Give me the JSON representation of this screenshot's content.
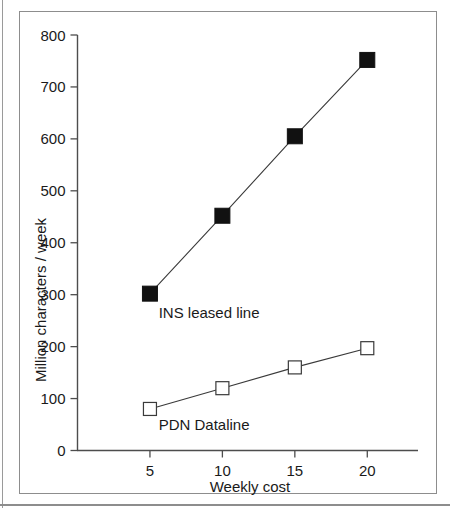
{
  "figure": {
    "frame_color": "#8d8d8d",
    "background": "#ffffff"
  },
  "chart_data": {
    "type": "line",
    "title": "",
    "subtitle": "",
    "xlabel": "Weekly cost",
    "ylabel": "Million characters / week",
    "x": [
      5,
      10,
      15,
      20
    ],
    "xlim": [
      0,
      23.5
    ],
    "ylim": [
      0,
      800
    ],
    "xticks": [
      5,
      10,
      15,
      20
    ],
    "xtick_labels": [
      "5",
      "10",
      "15",
      "20"
    ],
    "yticks": [
      0,
      100,
      200,
      300,
      400,
      500,
      600,
      700,
      800
    ],
    "ytick_labels": [
      "0",
      "100",
      "200",
      "300",
      "400",
      "500",
      "600",
      "700",
      "800"
    ],
    "grid": false,
    "legend_position": "inline-annotation",
    "series": [
      {
        "name": "INS leased line",
        "marker": "filled-square",
        "color": "#111111",
        "values": [
          302,
          452,
          605,
          752
        ],
        "annotation": "INS leased line"
      },
      {
        "name": "PDN Dataline",
        "marker": "open-square",
        "color": "#3a3a3a",
        "values": [
          80,
          120,
          160,
          197
        ],
        "annotation": "PDN Dataline"
      }
    ],
    "annotations": [
      {
        "text": "INS leased line",
        "x": 5.6,
        "y": 255
      },
      {
        "text": "PDN Dataline",
        "x": 5.6,
        "y": 40
      }
    ]
  },
  "axis": {
    "y_title": "Million characters / week",
    "x_title": "Weekly cost"
  }
}
